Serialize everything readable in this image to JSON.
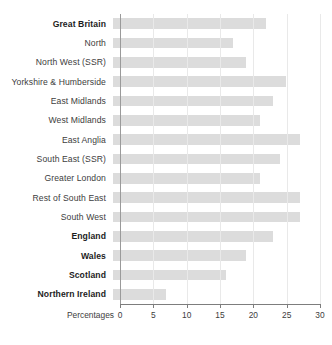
{
  "chart_data": {
    "type": "bar",
    "orientation": "horizontal",
    "title": "",
    "xlabel": "Percentages",
    "ylabel": "",
    "xlim": [
      0,
      30
    ],
    "xticks": [
      0,
      5,
      10,
      15,
      20,
      25,
      30
    ],
    "grid": true,
    "legend": null,
    "bar_color": "#dcdcdc",
    "axis_color": "#7d7d7d",
    "gridline_color": "#e9e9e9",
    "categories": [
      "Great Britain",
      "North",
      "North West (SSR)",
      "Yorkshire & Humberside",
      "East Midlands",
      "West Midlands",
      "East Anglia",
      "South East (SSR)",
      "Greater London",
      "Rest of South East",
      "South West",
      "England",
      "Wales",
      "Scotland",
      "Northern Ireland"
    ],
    "values": [
      23,
      18,
      20,
      26,
      24,
      22,
      28,
      25,
      22,
      28,
      28,
      24,
      20,
      17,
      8
    ],
    "emphasis": [
      true,
      false,
      false,
      false,
      false,
      false,
      false,
      false,
      false,
      false,
      false,
      true,
      true,
      true,
      true
    ]
  }
}
